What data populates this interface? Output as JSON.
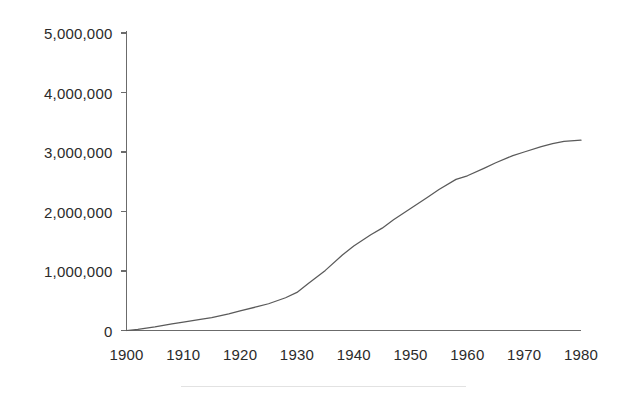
{
  "chart_data": {
    "type": "line",
    "title": "",
    "subtitle": "",
    "xlabel": "",
    "ylabel": "",
    "xlim": [
      1900,
      1980
    ],
    "ylim": [
      0,
      5000000
    ],
    "grid": false,
    "legend": "none",
    "x_tick_labels": [
      "1900",
      "1910",
      "1920",
      "1930",
      "1940",
      "1950",
      "1960",
      "1970",
      "1980"
    ],
    "x_ticks": [
      1900,
      1910,
      1920,
      1930,
      1940,
      1950,
      1960,
      1970,
      1980
    ],
    "y_tick_labels": [
      "0",
      "1,000,000",
      "2,000,000",
      "3,000,000",
      "4,000,000",
      "5,000,000"
    ],
    "y_ticks": [
      0,
      1000000,
      2000000,
      3000000,
      4000000,
      5000000
    ],
    "series": [
      {
        "name": "cumulative total",
        "color": "#5a5a5a",
        "x": [
          1900,
          1902,
          1905,
          1908,
          1910,
          1913,
          1915,
          1918,
          1920,
          1923,
          1925,
          1928,
          1930,
          1932,
          1935,
          1938,
          1940,
          1943,
          1945,
          1947,
          1950,
          1953,
          1955,
          1958,
          1960,
          1963,
          1965,
          1968,
          1970,
          1973,
          1975,
          1977,
          1980
        ],
        "values": [
          0,
          20000,
          60000,
          110000,
          140000,
          185000,
          215000,
          280000,
          330000,
          400000,
          450000,
          550000,
          640000,
          790000,
          1010000,
          1270000,
          1420000,
          1610000,
          1720000,
          1860000,
          2050000,
          2240000,
          2370000,
          2540000,
          2600000,
          2730000,
          2820000,
          2940000,
          3000000,
          3090000,
          3140000,
          3180000,
          3200000
        ]
      }
    ],
    "annotations": []
  },
  "axes": {
    "y_axis_name": "y-axis",
    "x_axis_name": "x-axis"
  },
  "caption_rule": {
    "present": true
  }
}
